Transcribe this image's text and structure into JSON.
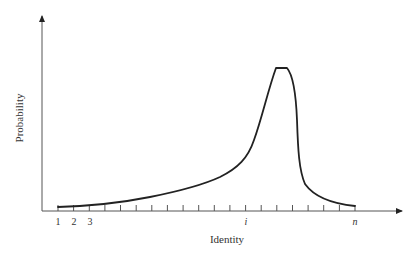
{
  "chart_data": {
    "type": "line",
    "title": "",
    "xlabel": "Identity",
    "ylabel": "Probability",
    "x_tick_labels": [
      {
        "index": 1,
        "label": "1"
      },
      {
        "index": 2,
        "label": "2"
      },
      {
        "index": 3,
        "label": "3"
      },
      {
        "index": 13,
        "label": "i"
      },
      {
        "index": 20,
        "label": "n"
      }
    ],
    "tick_count": 20,
    "grid": false,
    "legend": null,
    "series": [
      {
        "name": "Probability distribution over identities",
        "x": [
          1,
          3,
          5,
          7,
          9,
          11,
          12,
          13,
          14,
          15,
          15.7,
          16.3,
          17,
          17.5,
          18,
          19,
          20
        ],
        "values": [
          0.02,
          0.03,
          0.06,
          0.1,
          0.15,
          0.21,
          0.27,
          0.37,
          0.65,
          0.98,
          1.0,
          1.0,
          0.75,
          0.22,
          0.1,
          0.05,
          0.03
        ]
      }
    ],
    "annotations": [
      "Peak located shortly after identity i",
      "y-axis unscaled (no numeric ticks)"
    ],
    "ylim": [
      0,
      1.1
    ]
  },
  "axes": {
    "x_title": "Identity",
    "y_title": "Probability",
    "ticks": [
      "1",
      "2",
      "3",
      "i",
      "n"
    ]
  }
}
